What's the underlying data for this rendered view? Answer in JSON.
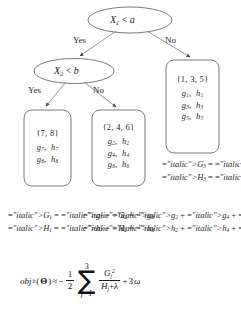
{
  "diagram": {
    "type": "decision-tree",
    "decision_nodes": [
      {
        "id": "root",
        "label": "X1 < a",
        "variable": "X",
        "subscript": "1",
        "operator": "<",
        "threshold": "a"
      },
      {
        "id": "internal",
        "label": "X2 < b",
        "variable": "X",
        "subscript": "2",
        "operator": "<",
        "threshold": "b"
      }
    ],
    "edge_labels": {
      "root_yes": "Yes",
      "root_no": "No",
      "internal_yes": "Yes",
      "internal_no": "No"
    },
    "leaves": [
      {
        "id": "leaf-1",
        "set": "{7, 8}",
        "rows": [
          {
            "g": "g",
            "g_sub": "7",
            "h": "h",
            "h_sub": "7"
          },
          {
            "g": "g",
            "g_sub": "8",
            "h": "h",
            "h_sub": "8"
          }
        ]
      },
      {
        "id": "leaf-2",
        "set": "{2, 4, 6}",
        "rows": [
          {
            "g": "g",
            "g_sub": "2",
            "h": "h",
            "h_sub": "2"
          },
          {
            "g": "g",
            "g_sub": "4",
            "h": "h",
            "h_sub": "4"
          },
          {
            "g": "g",
            "g_sub": "6",
            "h": "h",
            "h_sub": "6"
          }
        ]
      },
      {
        "id": "leaf-3",
        "set": "{1, 3, 5}",
        "rows": [
          {
            "g": "g",
            "g_sub": "1",
            "h": "h",
            "h_sub": "1"
          },
          {
            "g": "g",
            "g_sub": "3",
            "h": "h",
            "h_sub": "3"
          },
          {
            "g": "g",
            "g_sub": "5",
            "h": "h",
            "h_sub": "5"
          }
        ]
      }
    ],
    "aggregations": [
      {
        "id": "agg-1",
        "G": {
          "symbol": "G",
          "subscript": "1",
          "terms": [
            "g7",
            "g8"
          ],
          "text": "G1 = g7 + g8"
        },
        "H": {
          "symbol": "H",
          "subscript": "1",
          "terms": [
            "h7",
            "h8"
          ],
          "text": "H1 = h7 + h8"
        }
      },
      {
        "id": "agg-2",
        "G": {
          "symbol": "G",
          "subscript": "2",
          "terms": [
            "g2",
            "g4",
            "g6"
          ],
          "text": "G2 = g2 + g4 + g6"
        },
        "H": {
          "symbol": "H",
          "subscript": "2",
          "terms": [
            "h2",
            "h4",
            "h6"
          ],
          "text": "H2 = h2 + h4 + h6"
        }
      },
      {
        "id": "agg-3",
        "G": {
          "symbol": "G",
          "subscript": "3",
          "terms": [
            "g1",
            "g3",
            "g5"
          ],
          "text": "G3 = g1 + g3 + g5"
        },
        "H": {
          "symbol": "H",
          "subscript": "3",
          "terms": [
            "h1",
            "h3",
            "h5"
          ],
          "text": "H3 = h1 + h3 + h5"
        }
      }
    ],
    "objective": {
      "name": "obj",
      "name_subscript": "b",
      "argument": "Θ",
      "relation": "≈",
      "sign": "−",
      "fraction_numerator": "1",
      "fraction_denominator": "2",
      "sum_upper": "3",
      "sum_lower": "j=1",
      "sum_glyph": "∑",
      "ratio_numerator_symbol": "G",
      "ratio_numerator_subscript": "j",
      "ratio_numerator_exponent": "2",
      "ratio_denominator_symbol": "H",
      "ratio_denominator_subscript": "j",
      "ratio_denominator_plus": "+",
      "ratio_denominator_lambda": "λ",
      "tail_plus": "+",
      "tail_coefficient": "3",
      "tail_symbol": "ω",
      "full_text": "obj_b(Θ) ≈ -1/2 Σ_{j=1}^{3} G_j^2 / (H_j + λ) + 3ω"
    }
  },
  "colors": {
    "background": "#ffffff",
    "stroke": "#6e6e6e",
    "text": "#1a1a1a"
  }
}
